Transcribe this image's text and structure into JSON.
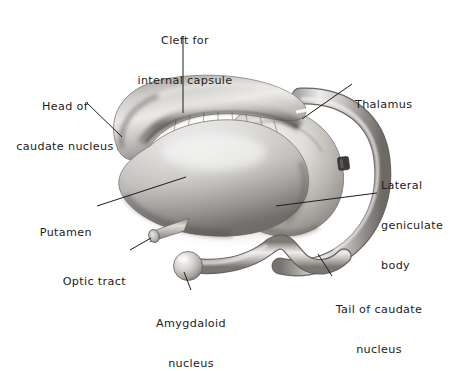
{
  "figure": {
    "background_color": "#ffffff",
    "ink_color": "#1c1c1c",
    "style": "grayscale airbrush anatomical illustration"
  },
  "labels": {
    "cleft": {
      "line1": "Cleft for",
      "line2": "internal capsule"
    },
    "head_caudate": {
      "line1": "Head of",
      "line2": "caudate nucleus"
    },
    "thalamus": {
      "line1": "Thalamus"
    },
    "lateral_geniculate": {
      "line1": "Lateral",
      "line2": "geniculate",
      "line3": "body"
    },
    "putamen": {
      "line1": "Putamen"
    },
    "optic_tract": {
      "line1": "Optic tract"
    },
    "amygdaloid": {
      "line1": "Amygdaloid",
      "line2": "nucleus"
    },
    "tail_caudate": {
      "line1": "Tail of caudate",
      "line2": "nucleus"
    }
  },
  "structures": [
    {
      "name": "head-of-caudate-nucleus",
      "description": "curved hook-shaped mass at upper left"
    },
    {
      "name": "putamen",
      "description": "large bright lens-shaped mass at center"
    },
    {
      "name": "thalamus",
      "description": "rounded egg-shaped mass right of center"
    },
    {
      "name": "tail-of-caudate-nucleus",
      "description": "long C-shaped tube arcing around thalamus"
    },
    {
      "name": "amygdaloid-nucleus",
      "description": "small sphere at lower center"
    },
    {
      "name": "optic-tract",
      "description": "short cut cylinder at lower left"
    },
    {
      "name": "lateral-geniculate-body",
      "description": "small dark notch on right arc"
    },
    {
      "name": "cleft-for-internal-capsule",
      "description": "dark groove between caudate head and putamen"
    }
  ]
}
